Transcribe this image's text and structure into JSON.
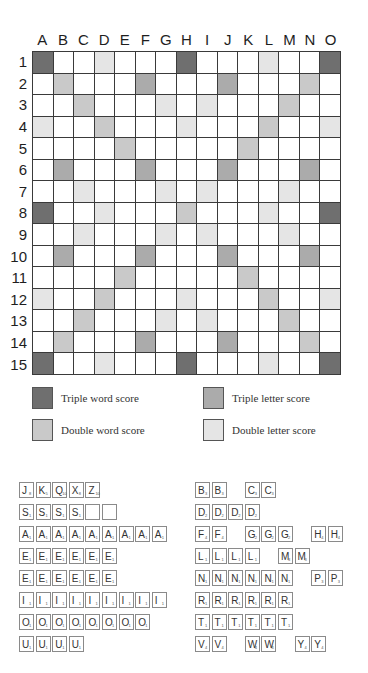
{
  "board": {
    "columns": [
      "A",
      "B",
      "C",
      "D",
      "E",
      "F",
      "G",
      "H",
      "I",
      "J",
      "K",
      "L",
      "M",
      "N",
      "O"
    ],
    "rows": [
      "1",
      "2",
      "3",
      "4",
      "5",
      "6",
      "7",
      "8",
      "9",
      "10",
      "11",
      "12",
      "13",
      "14",
      "15"
    ],
    "premium_colors": {
      "tw": "#6f6f6f",
      "tl": "#ababab",
      "dw": "#c9c9c9",
      "dl": "#e5e5e5",
      "plain": "#ffffff"
    },
    "layout": [
      "tw .  .  dl .  .  .  tw .  .  .  dl .  .  tw",
      ".  dw .  .  .  tl .  .  .  tl .  .  .  dw .",
      ".  .  dw .  .  .  dl .  dl .  .  .  dw .  .",
      "dl .  .  dw .  .  .  dl .  .  .  dw .  .  dl",
      ".  .  .  .  dw .  .  .  .  .  dw .  .  .  .",
      ".  tl .  .  .  tl .  .  .  tl .  .  .  tl .",
      ".  .  dl .  .  .  dl .  dl .  .  .  dl .  .",
      "tw .  .  dl .  .  .  dw .  .  .  dl .  .  tw",
      ".  .  dl .  .  .  dl .  dl .  .  .  dl .  .",
      ".  tl .  .  .  tl .  .  .  tl .  .  .  tl .",
      ".  .  .  .  dw .  .  .  .  .  dw .  .  .  .",
      "dl .  .  dw .  .  .  dl .  .  .  dw .  .  dl",
      ".  .  dw .  .  .  dl .  dl .  .  .  dw .  .",
      ".  dw .  .  .  tl .  .  .  tl .  .  .  dw .",
      "tw .  .  dl .  .  .  tw .  .  .  dl .  .  tw"
    ]
  },
  "legend": {
    "triple_word": "Triple word score",
    "triple_letter": "Triple letter score",
    "double_word": "Double word score",
    "double_letter": "Double letter score"
  },
  "tiles": {
    "left": [
      [
        {
          "l": "J",
          "v": 8,
          "s": 0
        },
        {
          "l": "K",
          "v": 5,
          "s": 1
        },
        {
          "l": "Q",
          "v": 10,
          "s": 2
        },
        {
          "l": "X",
          "v": 8,
          "s": 3
        },
        {
          "l": "Z",
          "v": 10,
          "s": 4
        }
      ],
      [
        {
          "l": "S",
          "v": 1,
          "s": 0
        },
        {
          "l": "S",
          "v": 1,
          "s": 1
        },
        {
          "l": "S",
          "v": 1,
          "s": 2
        },
        {
          "l": "S",
          "v": 1,
          "s": 3
        },
        {
          "l": "",
          "v": "",
          "s": 4
        },
        {
          "l": "",
          "v": "",
          "s": 5
        }
      ],
      [
        {
          "l": "A",
          "v": 1,
          "s": 0
        },
        {
          "l": "A",
          "v": 1,
          "s": 1
        },
        {
          "l": "A",
          "v": 1,
          "s": 2
        },
        {
          "l": "A",
          "v": 1,
          "s": 3
        },
        {
          "l": "A",
          "v": 1,
          "s": 4
        },
        {
          "l": "A",
          "v": 1,
          "s": 5
        },
        {
          "l": "A",
          "v": 1,
          "s": 6
        },
        {
          "l": "A",
          "v": 1,
          "s": 7
        },
        {
          "l": "A",
          "v": 1,
          "s": 8
        }
      ],
      [
        {
          "l": "E",
          "v": 1,
          "s": 0
        },
        {
          "l": "E",
          "v": 1,
          "s": 1
        },
        {
          "l": "E",
          "v": 1,
          "s": 2
        },
        {
          "l": "E",
          "v": 1,
          "s": 3
        },
        {
          "l": "E",
          "v": 1,
          "s": 4
        },
        {
          "l": "E",
          "v": 1,
          "s": 5
        }
      ],
      [
        {
          "l": "E",
          "v": 1,
          "s": 0
        },
        {
          "l": "E",
          "v": 1,
          "s": 1
        },
        {
          "l": "E",
          "v": 1,
          "s": 2
        },
        {
          "l": "E",
          "v": 1,
          "s": 3
        },
        {
          "l": "E",
          "v": 1,
          "s": 4
        },
        {
          "l": "E",
          "v": 1,
          "s": 5
        }
      ],
      [
        {
          "l": "I",
          "v": 1,
          "s": 0
        },
        {
          "l": "I",
          "v": 1,
          "s": 1
        },
        {
          "l": "I",
          "v": 1,
          "s": 2
        },
        {
          "l": "I",
          "v": 1,
          "s": 3
        },
        {
          "l": "I",
          "v": 1,
          "s": 4
        },
        {
          "l": "I",
          "v": 1,
          "s": 5
        },
        {
          "l": "I",
          "v": 1,
          "s": 6
        },
        {
          "l": "I",
          "v": 1,
          "s": 7
        },
        {
          "l": "I",
          "v": 1,
          "s": 8
        }
      ],
      [
        {
          "l": "O",
          "v": 1,
          "s": 0
        },
        {
          "l": "O",
          "v": 1,
          "s": 1
        },
        {
          "l": "O",
          "v": 1,
          "s": 2
        },
        {
          "l": "O",
          "v": 1,
          "s": 3
        },
        {
          "l": "O",
          "v": 1,
          "s": 4
        },
        {
          "l": "O",
          "v": 1,
          "s": 5
        },
        {
          "l": "O",
          "v": 1,
          "s": 6
        },
        {
          "l": "O",
          "v": 1,
          "s": 7
        }
      ],
      [
        {
          "l": "U",
          "v": 1,
          "s": 0
        },
        {
          "l": "U",
          "v": 1,
          "s": 1
        },
        {
          "l": "U",
          "v": 1,
          "s": 2
        },
        {
          "l": "U",
          "v": 1,
          "s": 3
        }
      ]
    ],
    "right": [
      [
        {
          "l": "B",
          "v": 3,
          "s": 0
        },
        {
          "l": "B",
          "v": 3,
          "s": 1
        },
        {
          "l": "C",
          "v": 3,
          "s": 3
        },
        {
          "l": "C",
          "v": 3,
          "s": 4
        }
      ],
      [
        {
          "l": "D",
          "v": 2,
          "s": 0
        },
        {
          "l": "D",
          "v": 2,
          "s": 1
        },
        {
          "l": "D",
          "v": 2,
          "s": 2
        },
        {
          "l": "D",
          "v": 2,
          "s": 3
        }
      ],
      [
        {
          "l": "F",
          "v": 4,
          "s": 0
        },
        {
          "l": "F",
          "v": 4,
          "s": 1
        },
        {
          "l": "G",
          "v": 2,
          "s": 3
        },
        {
          "l": "G",
          "v": 2,
          "s": 4
        },
        {
          "l": "G",
          "v": 2,
          "s": 5
        },
        {
          "l": "H",
          "v": 4,
          "s": 7
        },
        {
          "l": "H",
          "v": 4,
          "s": 8
        }
      ],
      [
        {
          "l": "L",
          "v": 1,
          "s": 0
        },
        {
          "l": "L",
          "v": 1,
          "s": 1
        },
        {
          "l": "L",
          "v": 1,
          "s": 2
        },
        {
          "l": "L",
          "v": 1,
          "s": 3
        },
        {
          "l": "M",
          "v": 3,
          "s": 5
        },
        {
          "l": "M",
          "v": 3,
          "s": 6
        }
      ],
      [
        {
          "l": "N",
          "v": 1,
          "s": 0
        },
        {
          "l": "N",
          "v": 1,
          "s": 1
        },
        {
          "l": "N",
          "v": 1,
          "s": 2
        },
        {
          "l": "N",
          "v": 1,
          "s": 3
        },
        {
          "l": "N",
          "v": 1,
          "s": 4
        },
        {
          "l": "N",
          "v": 1,
          "s": 5
        },
        {
          "l": "P",
          "v": 3,
          "s": 7
        },
        {
          "l": "P",
          "v": 3,
          "s": 8
        }
      ],
      [
        {
          "l": "R",
          "v": 1,
          "s": 0
        },
        {
          "l": "R",
          "v": 1,
          "s": 1
        },
        {
          "l": "R",
          "v": 1,
          "s": 2
        },
        {
          "l": "R",
          "v": 1,
          "s": 3
        },
        {
          "l": "R",
          "v": 1,
          "s": 4
        },
        {
          "l": "R",
          "v": 1,
          "s": 5
        }
      ],
      [
        {
          "l": "T",
          "v": 1,
          "s": 0
        },
        {
          "l": "T",
          "v": 1,
          "s": 1
        },
        {
          "l": "T",
          "v": 1,
          "s": 2
        },
        {
          "l": "T",
          "v": 1,
          "s": 3
        },
        {
          "l": "T",
          "v": 1,
          "s": 4
        },
        {
          "l": "T",
          "v": 1,
          "s": 5
        }
      ],
      [
        {
          "l": "V",
          "v": 4,
          "s": 0
        },
        {
          "l": "V",
          "v": 4,
          "s": 1
        },
        {
          "l": "W",
          "v": 4,
          "s": 3
        },
        {
          "l": "W",
          "v": 4,
          "s": 4
        },
        {
          "l": "Y",
          "v": 4,
          "s": 6
        },
        {
          "l": "Y",
          "v": 4,
          "s": 7
        }
      ]
    ]
  }
}
